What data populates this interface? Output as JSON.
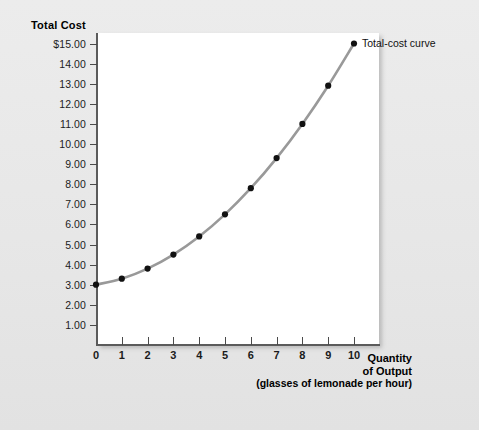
{
  "figure": {
    "y_axis_title": "Total Cost",
    "x_axis_title_line1": "Quantity",
    "x_axis_title_line2": "of Output",
    "x_axis_subtitle": "(glasses of lemonade per hour)",
    "series_label": "Total-cost curve",
    "curve_color": "#999999",
    "point_color": "#111111",
    "axis_color": "#5b5b5b",
    "panel_color": "#ffffff",
    "background_color": "#e9e9e9"
  },
  "chart_data": {
    "type": "line",
    "title": "",
    "subtitle": "",
    "xlabel": "Quantity of Output (glasses of lemonade per hour)",
    "ylabel": "Total Cost",
    "xlim": [
      0,
      11
    ],
    "ylim": [
      0,
      15.6
    ],
    "grid": false,
    "legend_position": "inline-right-of-last-point",
    "x_tick_labels": [
      "0",
      "1",
      "2",
      "3",
      "4",
      "5",
      "6",
      "7",
      "8",
      "9",
      "10"
    ],
    "x_ticks": [
      0,
      1,
      2,
      3,
      4,
      5,
      6,
      7,
      8,
      9,
      10
    ],
    "y_tick_labels": [
      "$15.00",
      "14.00",
      "13.00",
      "12.00",
      "11.00",
      "10.00",
      "9.00",
      "8.00",
      "7.00",
      "6.00",
      "5.00",
      "4.00",
      "3.00",
      "2.00",
      "1.00"
    ],
    "y_ticks": [
      15,
      14,
      13,
      12,
      11,
      10,
      9,
      8,
      7,
      6,
      5,
      4,
      3,
      2,
      1
    ],
    "series": [
      {
        "name": "Total-cost curve",
        "x": [
          0,
          1,
          2,
          3,
          4,
          5,
          6,
          7,
          8,
          9,
          10
        ],
        "values": [
          3.0,
          3.3,
          3.8,
          4.5,
          5.4,
          6.5,
          7.8,
          9.3,
          11.0,
          12.9,
          15.0
        ],
        "marker": "circle",
        "color": "#999999"
      }
    ],
    "annotations": [
      {
        "text": "Total-cost curve",
        "x": 10,
        "y": 15.0
      }
    ]
  }
}
